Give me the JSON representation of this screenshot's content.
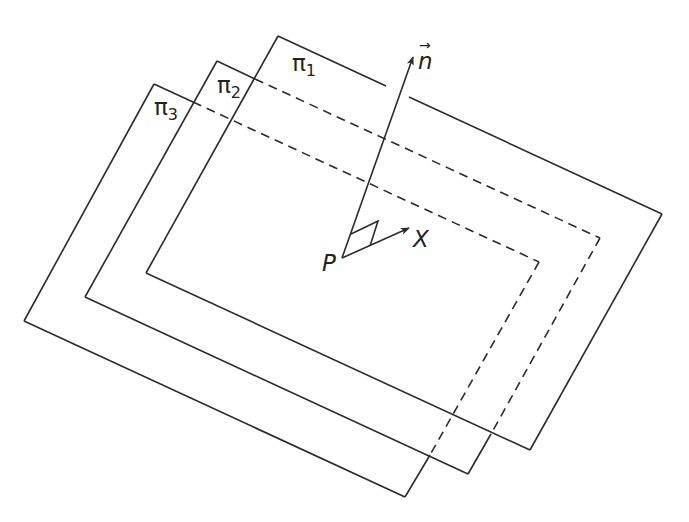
{
  "diagram": {
    "colors": {
      "line": "#2b2b2b",
      "background": "#ffffff",
      "text": "#222222"
    },
    "planes": [
      {
        "id": "pi1",
        "label_base": "π",
        "label_sub": "1",
        "label_pos": [
          292,
          52
        ],
        "corners": {
          "top_left": [
            278,
            36
          ],
          "top_right": [
            662,
            214
          ],
          "bottom_right": [
            530,
            450
          ],
          "bottom_left": [
            146,
            273
          ]
        },
        "solid_segments": [
          [
            [
              278,
              36
            ],
            [
              386,
              86
            ]
          ],
          [
            [
              409,
              97
            ],
            [
              662,
              214
            ]
          ],
          [
            [
              662,
              214
            ],
            [
              530,
              450
            ]
          ],
          [
            [
              530,
              450
            ],
            [
              146,
              273
            ]
          ],
          [
            [
              146,
              273
            ],
            [
              278,
              36
            ]
          ]
        ],
        "dashed_segments": []
      },
      {
        "id": "pi2",
        "label_base": "π",
        "label_sub": "2",
        "label_pos": [
          217,
          74
        ],
        "corners": {
          "top_left": [
            217,
            61
          ],
          "top_right": [
            600,
            238
          ],
          "bottom_right": [
            468,
            474
          ],
          "bottom_left": [
            85,
            297
          ]
        },
        "solid_segments": [
          [
            [
              217,
              61
            ],
            [
              255,
              79
            ]
          ],
          [
            [
              491,
              434
            ],
            [
              468,
              474
            ]
          ],
          [
            [
              468,
              474
            ],
            [
              85,
              297
            ]
          ],
          [
            [
              85,
              297
            ],
            [
              217,
              61
            ]
          ]
        ],
        "dashed_segments": [
          [
            [
              255,
              79
            ],
            [
              600,
              238
            ]
          ],
          [
            [
              600,
              238
            ],
            [
              491,
              434
            ]
          ]
        ]
      },
      {
        "id": "pi3",
        "label_base": "π",
        "label_sub": "3",
        "label_pos": [
          154,
          96
        ],
        "corners": {
          "top_left": [
            154,
            84
          ],
          "top_right": [
            539,
            262
          ],
          "bottom_right": [
            405,
            497
          ],
          "bottom_left": [
            24,
            321
          ]
        },
        "solid_segments": [
          [
            [
              154,
              84
            ],
            [
              193,
              102
            ]
          ],
          [
            [
              430,
              455
            ],
            [
              405,
              497
            ]
          ],
          [
            [
              405,
              497
            ],
            [
              24,
              321
            ]
          ],
          [
            [
              24,
              321
            ],
            [
              154,
              84
            ]
          ]
        ],
        "dashed_segments": [
          [
            [
              193,
              102
            ],
            [
              539,
              262
            ]
          ],
          [
            [
              539,
              262
            ],
            [
              430,
              455
            ]
          ]
        ]
      }
    ],
    "normal_vector": {
      "label": "n",
      "arrow_symbol": "→",
      "from": [
        342,
        258
      ],
      "to": [
        413,
        57
      ],
      "label_pos": [
        418,
        50
      ]
    },
    "point_P": {
      "label": "P",
      "pos": [
        342,
        258
      ],
      "label_pos": [
        322,
        252
      ]
    },
    "vector_X": {
      "label": "X",
      "from": [
        342,
        258
      ],
      "to": [
        409,
        228
      ],
      "label_pos": [
        413,
        228
      ]
    },
    "right_angle_marker": [
      [
        351,
        234
      ],
      [
        378,
        221
      ],
      [
        370,
        246
      ]
    ]
  }
}
